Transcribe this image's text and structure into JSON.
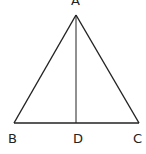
{
  "diagram": {
    "type": "geometry",
    "points": {
      "A": {
        "label": "A",
        "x": 76,
        "y": 15
      },
      "B": {
        "label": "B",
        "x": 14,
        "y": 123
      },
      "C": {
        "label": "C",
        "x": 139,
        "y": 123
      },
      "D": {
        "label": "D",
        "x": 76,
        "y": 123
      }
    },
    "segments": [
      "AB",
      "AC",
      "BC",
      "AD"
    ],
    "stroke_color": "#222222"
  }
}
